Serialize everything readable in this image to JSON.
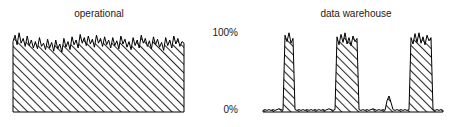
{
  "figure": {
    "width": 457,
    "height": 127,
    "background": "#ffffff",
    "ink_color": "#000000",
    "hatch_color": "#3a3a3a"
  },
  "axis": {
    "top_label": "100%",
    "bottom_label": "0%",
    "top_y_px": 32,
    "bottom_y_px": 112
  },
  "panels": [
    {
      "id": "operational",
      "title": "operational"
    },
    {
      "id": "warehouse",
      "title": "data warehouse"
    }
  ],
  "chart_data": [
    {
      "type": "area",
      "title": "operational",
      "xlabel": "",
      "ylabel": "",
      "ylim": [
        0,
        100
      ],
      "ytick_labels": [
        "0%",
        "100%"
      ],
      "ytick_values": [
        0,
        100
      ],
      "grid": false,
      "legend": "none",
      "fill": "diagonal-hatch",
      "annotation": "continuous near-capacity utilization with small rapid fluctuations",
      "x": [
        0,
        1,
        2,
        3,
        4,
        5,
        6,
        7,
        8,
        9,
        10,
        11,
        12,
        13,
        14,
        15,
        16,
        17,
        18,
        19,
        20,
        21,
        22,
        23,
        24,
        25,
        26,
        27,
        28,
        29,
        30,
        31,
        32,
        33,
        34,
        35,
        36,
        37,
        38,
        39,
        40,
        41,
        42,
        43,
        44,
        45,
        46,
        47,
        48,
        49,
        50,
        51,
        52,
        53,
        54,
        55,
        56,
        57,
        58,
        59,
        60,
        61,
        62,
        63,
        64,
        65,
        66,
        67,
        68,
        69,
        70,
        71,
        72,
        73,
        74,
        75,
        76,
        77,
        78,
        79,
        80,
        81,
        82,
        83,
        84
      ],
      "values": [
        88,
        96,
        84,
        99,
        86,
        92,
        82,
        95,
        83,
        90,
        80,
        88,
        79,
        93,
        82,
        86,
        78,
        91,
        80,
        87,
        76,
        90,
        79,
        85,
        75,
        92,
        81,
        88,
        78,
        94,
        84,
        90,
        80,
        97,
        86,
        93,
        83,
        95,
        85,
        91,
        81,
        96,
        86,
        92,
        82,
        94,
        84,
        90,
        80,
        93,
        83,
        89,
        79,
        95,
        85,
        91,
        81,
        88,
        78,
        93,
        83,
        90,
        80,
        96,
        86,
        92,
        82,
        89,
        79,
        94,
        84,
        91,
        81,
        87,
        77,
        93,
        83,
        90,
        80,
        95,
        85,
        92,
        82,
        88,
        86
      ]
    },
    {
      "type": "area",
      "title": "data warehouse",
      "xlabel": "",
      "ylabel": "",
      "ylim": [
        0,
        100
      ],
      "ytick_labels": [
        "0%",
        "100%"
      ],
      "ytick_values": [
        0,
        100
      ],
      "grid": false,
      "legend": "none",
      "fill": "diagonal-hatch",
      "annotation": "mostly idle with three tall burst spikes and one small bump",
      "x": [
        0,
        1,
        2,
        3,
        4,
        5,
        6,
        7,
        8,
        9,
        10,
        11,
        12,
        13,
        14,
        15,
        16,
        17,
        18,
        19,
        20,
        21,
        22,
        23,
        24,
        25,
        26,
        27,
        28,
        29,
        30,
        31,
        32,
        33,
        34,
        35,
        36,
        37,
        38,
        39,
        40,
        41,
        42,
        43,
        44,
        45,
        46,
        47,
        48,
        49,
        50,
        51,
        52,
        53,
        54,
        55,
        56,
        57,
        58,
        59,
        60,
        61,
        62,
        63,
        64,
        65,
        66,
        67,
        68,
        69,
        70,
        71,
        72,
        73,
        74,
        75,
        76,
        77,
        78,
        79,
        80,
        81,
        82,
        83,
        84,
        85,
        86,
        87,
        88,
        89,
        90
      ],
      "values": [
        2,
        3,
        2,
        3,
        2,
        3,
        2,
        3,
        4,
        3,
        2,
        96,
        88,
        99,
        86,
        92,
        3,
        2,
        3,
        2,
        3,
        2,
        3,
        2,
        3,
        2,
        3,
        2,
        3,
        2,
        3,
        2,
        3,
        4,
        3,
        2,
        3,
        94,
        84,
        97,
        87,
        99,
        85,
        93,
        83,
        95,
        88,
        92,
        3,
        2,
        3,
        2,
        3,
        2,
        3,
        4,
        3,
        2,
        3,
        2,
        3,
        2,
        14,
        20,
        12,
        3,
        2,
        3,
        2,
        3,
        2,
        3,
        2,
        3,
        93,
        85,
        98,
        87,
        99,
        86,
        94,
        84,
        96,
        89,
        93,
        3,
        2,
        3,
        2,
        3,
        2
      ],
      "spikes": [
        {
          "label": "burst-1",
          "start_x": 11,
          "end_x": 15,
          "peak": 99,
          "width": "narrow"
        },
        {
          "label": "burst-2",
          "start_x": 37,
          "end_x": 47,
          "peak": 99,
          "width": "medium"
        },
        {
          "label": "minor-bump",
          "start_x": 62,
          "end_x": 64,
          "peak": 20,
          "width": "tiny"
        },
        {
          "label": "burst-3",
          "start_x": 74,
          "end_x": 84,
          "peak": 99,
          "width": "wide"
        }
      ]
    }
  ],
  "plot_geometry": {
    "operational": {
      "left_px": 13,
      "right_px": 184,
      "top_px": 32,
      "baseline_px": 112
    },
    "warehouse": {
      "left_px": 263,
      "right_px": 443,
      "top_px": 32,
      "baseline_px": 112
    }
  }
}
